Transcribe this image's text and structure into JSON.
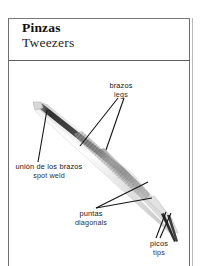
{
  "entry": {
    "title_es": "Pinzas",
    "title_en": "Tweezers"
  },
  "callouts": [
    {
      "id": "legs",
      "es": "brazos",
      "en": "legs"
    },
    {
      "id": "spot_weld",
      "es": "unión de los brazos",
      "en": "spot weld"
    },
    {
      "id": "diagonals",
      "es": "puntas",
      "en": "diagonals"
    },
    {
      "id": "tips",
      "es": "picos",
      "en": "tips"
    }
  ],
  "illustration": {
    "subject": "tweezers-diagram",
    "description": "Pair of metal tweezers oriented diagonally from upper-left to lower-right",
    "colors": {
      "frame_border": "#6e6e6e",
      "rule": "#5d5d5d",
      "leader_line": "#1a1a1a",
      "metal_dark": "#3a3a3a",
      "metal_mid": "#9a9a9a",
      "metal_light": "#e8e8e8",
      "text": "#161616"
    }
  }
}
